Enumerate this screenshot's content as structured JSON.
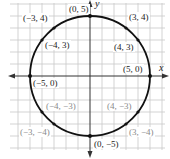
{
  "diagram": {
    "axes": {
      "x_label": "x",
      "y_label": "y"
    },
    "colors": {
      "grid": "#c8c8c8",
      "axis": "#333333",
      "circle": "#111111",
      "faint_label": "#8a8a8a"
    },
    "points": [
      {
        "label": "(0, 5)",
        "x": 0,
        "y": 5,
        "style": "dark"
      },
      {
        "label": "(3, 4)",
        "x": 3,
        "y": 4,
        "style": "dark"
      },
      {
        "label": "(−3, 4)",
        "x": -3,
        "y": 4,
        "style": "dark"
      },
      {
        "label": "(−4, 3)",
        "x": -4,
        "y": 3,
        "style": "dark"
      },
      {
        "label": "(4, 3)",
        "x": 4,
        "y": 3,
        "style": "dark"
      },
      {
        "label": "(−5, 0)",
        "x": -5,
        "y": 0,
        "style": "dark"
      },
      {
        "label": "(5, 0)",
        "x": 5,
        "y": 0,
        "style": "dark"
      },
      {
        "label": "(−4, −3)",
        "x": -4,
        "y": -3,
        "style": "faint"
      },
      {
        "label": "(4, −3)",
        "x": 4,
        "y": -3,
        "style": "faint"
      },
      {
        "label": "(−3, −4)",
        "x": -3,
        "y": -4,
        "style": "faint"
      },
      {
        "label": "(3, −4)",
        "x": 3,
        "y": -4,
        "style": "faint"
      },
      {
        "label": "(0, −5)",
        "x": 0,
        "y": -5,
        "style": "dark"
      }
    ]
  }
}
